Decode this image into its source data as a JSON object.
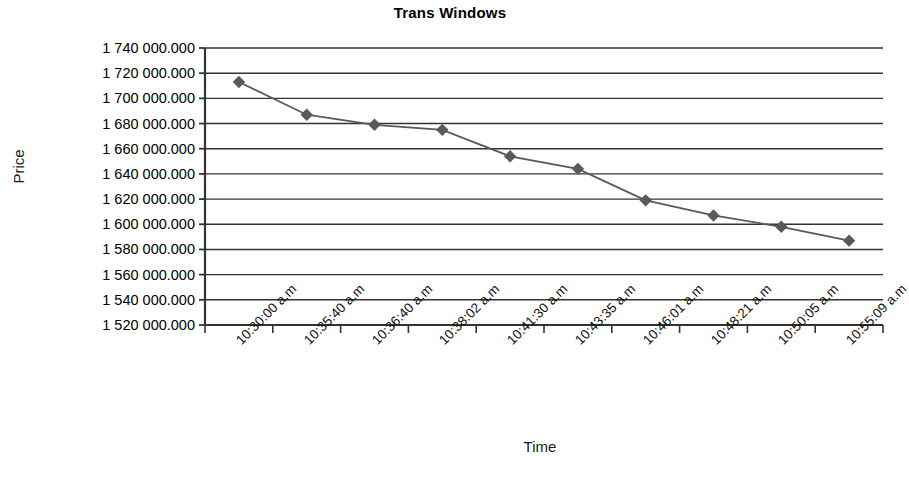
{
  "chart_data": {
    "type": "line",
    "title": "Trans Windows",
    "xlabel": "Time",
    "ylabel": "Price",
    "grid": true,
    "legend": false,
    "marker": "diamond",
    "series_color": "#595959",
    "line_color": "#595959",
    "categories": [
      "10:30:00 a.m",
      "10:35:40 a.m",
      "10:36:40 a.m",
      "10:38:02 a.m",
      "10:41:30 a.m",
      "10:43:35 a.m",
      "10:46:01 a.m",
      "10:48:21 a.m",
      "10:50:05 a.m",
      "10:55:09 a.m"
    ],
    "values": [
      1713000.0,
      1687000.0,
      1679000.0,
      1675000.0,
      1654000.0,
      1644000.0,
      1619000.0,
      1607000.0,
      1598000.0,
      1587000.0
    ],
    "ylim": [
      1520000.0,
      1740000.0
    ],
    "ytick_step": 20000.0,
    "yticks": [
      1740000.0,
      1720000.0,
      1700000.0,
      1680000.0,
      1660000.0,
      1640000.0,
      1620000.0,
      1600000.0,
      1580000.0,
      1560000.0,
      1540000.0,
      1520000.0
    ],
    "ytick_labels": [
      "1 740 000.000",
      "1 720 000.000",
      "1 700 000.000",
      "1 680 000.000",
      "1 660 000.000",
      "1 640 000.000",
      "1 620 000.000",
      "1 600 000.000",
      "1 580 000.000",
      "1 560 000.000",
      "1 540 000.000",
      "1 520 000.000"
    ],
    "axis_color": "#333333"
  }
}
